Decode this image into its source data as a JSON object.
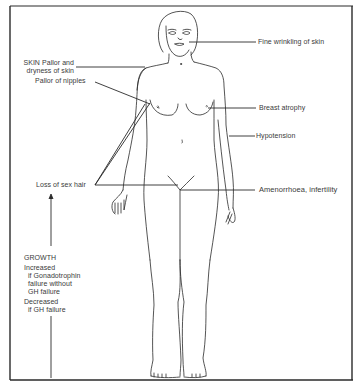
{
  "diagram": {
    "type": "anatomical-annotation",
    "colors": {
      "line": "#2a2a2a",
      "text": "#3a3a3a",
      "background": "#ffffff"
    }
  },
  "labels": {
    "fine_wrinkling": "Fine wrinkling of skin",
    "skin_line1": "SKIN Pallor and",
    "skin_line2": "dryness of skin",
    "pallor_nipples": "Pallor of nipples",
    "breast_atrophy": "Breast atrophy",
    "hypotension": "Hypotension",
    "loss_sex_hair": "Loss of sex hair",
    "amenorrhoea": "Amenorrhoea, infertility",
    "growth": {
      "title": "GROWTH",
      "increased": "Increased",
      "increased_l2": "if Gonadotrophin",
      "increased_l3": "failure without",
      "increased_l4": "GH failure",
      "decreased": "Decreased",
      "decreased_l2": "if GH failure"
    }
  }
}
